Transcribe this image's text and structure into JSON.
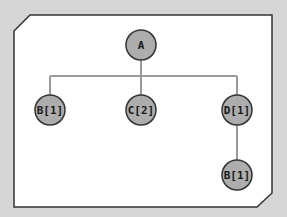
{
  "diagram": {
    "type": "tree",
    "colors": {
      "background": "#d6d6d6",
      "panel": "#ffffff",
      "panel_border": "#333333",
      "node_fill": "#adadad",
      "node_stroke": "#333333",
      "edge": "#9a9a9a"
    },
    "nodes": [
      {
        "id": "A",
        "label": "A",
        "x": 141,
        "y": 45
      },
      {
        "id": "B1",
        "label": "B[1]",
        "x": 50,
        "y": 110
      },
      {
        "id": "C2",
        "label": "C[2]",
        "x": 141,
        "y": 110
      },
      {
        "id": "D1",
        "label": "D[1]",
        "x": 237,
        "y": 110
      },
      {
        "id": "B1b",
        "label": "B[1]",
        "x": 237,
        "y": 175
      }
    ],
    "edges": [
      {
        "from": "A",
        "to": "B1"
      },
      {
        "from": "A",
        "to": "C2"
      },
      {
        "from": "A",
        "to": "D1"
      },
      {
        "from": "D1",
        "to": "B1b"
      }
    ]
  }
}
